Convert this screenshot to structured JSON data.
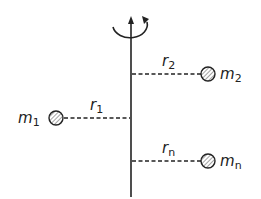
{
  "diagram": {
    "axis": {
      "label": "rotation-axis",
      "direction": "counterclockwise"
    },
    "masses": [
      {
        "name": "m1",
        "mass_label": "m",
        "mass_sub": "1",
        "radius_label": "r",
        "radius_sub": "1",
        "side": "left"
      },
      {
        "name": "m2",
        "mass_label": "m",
        "mass_sub": "2",
        "radius_label": "r",
        "radius_sub": "2",
        "side": "right"
      },
      {
        "name": "mn",
        "mass_label": "m",
        "mass_sub": "n",
        "radius_label": "r",
        "radius_sub": "n",
        "side": "right"
      }
    ],
    "colors": {
      "line": "#222222",
      "fill": "#ffffff",
      "hatch": "#555555"
    }
  }
}
